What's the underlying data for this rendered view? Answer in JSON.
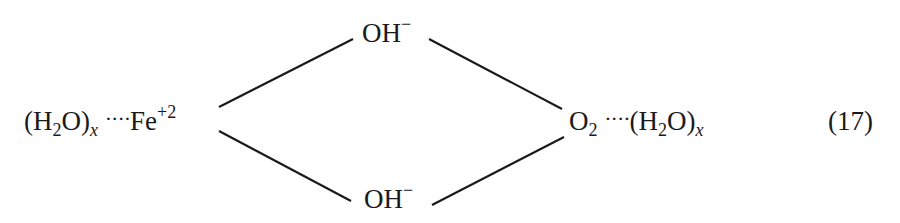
{
  "equation": {
    "number": "(17)",
    "left": {
      "water": "(H",
      "water_sub": "2",
      "water_tail": "O)",
      "index": "x",
      "dots": "····",
      "metal": "Fe",
      "charge": "+2"
    },
    "right": {
      "oxygen": "O",
      "oxygen_sub": "2",
      "dots": "····",
      "water": "(H",
      "water_sub": "2",
      "water_tail": "O)",
      "index": "x"
    },
    "bridge_top": {
      "label": "OH",
      "charge": "−"
    },
    "bridge_bottom": {
      "label": "OH",
      "charge": "−"
    },
    "line_color": "#1a1a1a"
  }
}
